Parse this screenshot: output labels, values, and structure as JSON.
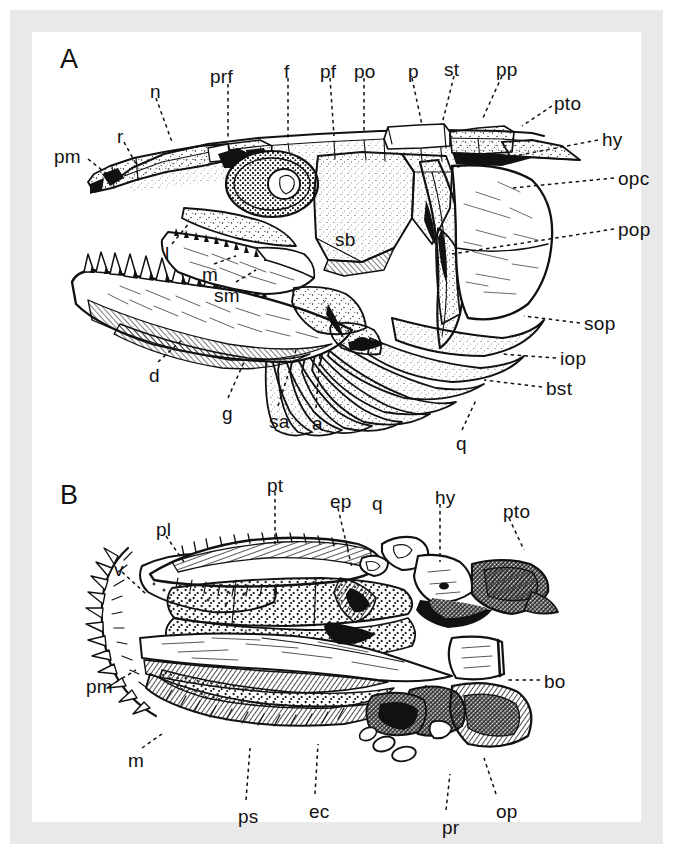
{
  "figure": {
    "caption_present": false,
    "background_color": "#ffffff",
    "mount_color": "#e9e9e9",
    "ink_color": "#111111",
    "panels": [
      {
        "id": "A",
        "letter": "A",
        "view": "lateral view of skull",
        "letter_pos": {
          "x": 28,
          "y": 14
        }
      },
      {
        "id": "B",
        "letter": "B",
        "view": "palatal (ventral) view of skull",
        "letter_pos": {
          "x": 28,
          "y": 450
        }
      }
    ],
    "labels_panel_a": [
      {
        "text": "A",
        "x": 28,
        "y": 14,
        "leader": null,
        "is_letter": true
      },
      {
        "text": "pm",
        "x": 22,
        "y": 115,
        "leader": {
          "x1": 56,
          "y1": 127,
          "x2": 80,
          "y2": 146
        }
      },
      {
        "text": "r",
        "x": 85,
        "y": 95,
        "leader": {
          "x1": 92,
          "y1": 110,
          "x2": 104,
          "y2": 132
        }
      },
      {
        "text": "n",
        "x": 118,
        "y": 50,
        "leader": {
          "x1": 124,
          "y1": 66,
          "x2": 140,
          "y2": 110
        }
      },
      {
        "text": "prf",
        "x": 178,
        "y": 35,
        "leader": {
          "x1": 196,
          "y1": 52,
          "x2": 196,
          "y2": 106
        }
      },
      {
        "text": "f",
        "x": 252,
        "y": 30,
        "leader": {
          "x1": 256,
          "y1": 46,
          "x2": 256,
          "y2": 106
        }
      },
      {
        "text": "pf",
        "x": 288,
        "y": 30,
        "leader": {
          "x1": 298,
          "y1": 46,
          "x2": 302,
          "y2": 104
        }
      },
      {
        "text": "po",
        "x": 322,
        "y": 30,
        "leader": {
          "x1": 332,
          "y1": 46,
          "x2": 332,
          "y2": 100
        }
      },
      {
        "text": "p",
        "x": 376,
        "y": 30,
        "leader": {
          "x1": 380,
          "y1": 46,
          "x2": 390,
          "y2": 93
        }
      },
      {
        "text": "st",
        "x": 412,
        "y": 28,
        "leader": {
          "x1": 422,
          "y1": 44,
          "x2": 410,
          "y2": 92
        }
      },
      {
        "text": "pp",
        "x": 464,
        "y": 28,
        "leader": {
          "x1": 470,
          "y1": 44,
          "x2": 450,
          "y2": 88
        }
      },
      {
        "text": "pto",
        "x": 522,
        "y": 62,
        "leader": {
          "x1": 520,
          "y1": 74,
          "x2": 490,
          "y2": 94
        }
      },
      {
        "text": "hy",
        "x": 570,
        "y": 98,
        "leader": {
          "x1": 566,
          "y1": 108,
          "x2": 420,
          "y2": 136
        }
      },
      {
        "text": "opc",
        "x": 586,
        "y": 137,
        "leader": {
          "x1": 582,
          "y1": 146,
          "x2": 480,
          "y2": 156
        }
      },
      {
        "text": "pop",
        "x": 586,
        "y": 188,
        "leader": {
          "x1": 582,
          "y1": 197,
          "x2": 420,
          "y2": 222
        }
      },
      {
        "text": "sop",
        "x": 552,
        "y": 282,
        "leader": {
          "x1": 548,
          "y1": 291,
          "x2": 492,
          "y2": 284
        }
      },
      {
        "text": "iop",
        "x": 528,
        "y": 317,
        "leader": {
          "x1": 524,
          "y1": 326,
          "x2": 470,
          "y2": 322
        }
      },
      {
        "text": "bst",
        "x": 514,
        "y": 347,
        "leader": {
          "x1": 510,
          "y1": 355,
          "x2": 452,
          "y2": 348
        }
      },
      {
        "text": "q",
        "x": 424,
        "y": 402,
        "leader": {
          "x1": 430,
          "y1": 398,
          "x2": 444,
          "y2": 368
        }
      },
      {
        "text": "sb",
        "x": 303,
        "y": 198,
        "leader": null
      },
      {
        "text": "l",
        "x": 133,
        "y": 212,
        "leader": {
          "x1": 140,
          "y1": 212,
          "x2": 158,
          "y2": 190
        }
      },
      {
        "text": "m",
        "x": 170,
        "y": 233,
        "leader": {
          "x1": 182,
          "y1": 232,
          "x2": 204,
          "y2": 224
        }
      },
      {
        "text": "sm",
        "x": 182,
        "y": 254,
        "leader": {
          "x1": 204,
          "y1": 250,
          "x2": 224,
          "y2": 238
        }
      },
      {
        "text": "d",
        "x": 117,
        "y": 334,
        "leader": {
          "x1": 126,
          "y1": 330,
          "x2": 150,
          "y2": 308
        }
      },
      {
        "text": "g",
        "x": 190,
        "y": 372,
        "leader": {
          "x1": 196,
          "y1": 366,
          "x2": 212,
          "y2": 330
        }
      },
      {
        "text": "sa",
        "x": 237,
        "y": 380,
        "leader": {
          "x1": 246,
          "y1": 374,
          "x2": 264,
          "y2": 318
        }
      },
      {
        "text": "a",
        "x": 280,
        "y": 382,
        "leader": {
          "x1": 284,
          "y1": 376,
          "x2": 288,
          "y2": 322
        }
      }
    ],
    "labels_panel_b": [
      {
        "text": "B",
        "x": 28,
        "y": 450,
        "leader": null,
        "is_letter": true
      },
      {
        "text": "pt",
        "x": 235,
        "y": 444,
        "leader": {
          "x1": 243,
          "y1": 460,
          "x2": 243,
          "y2": 512
        }
      },
      {
        "text": "ep",
        "x": 298,
        "y": 460,
        "leader": {
          "x1": 306,
          "y1": 476,
          "x2": 320,
          "y2": 536
        }
      },
      {
        "text": "q",
        "x": 340,
        "y": 462,
        "leader": null
      },
      {
        "text": "hy",
        "x": 403,
        "y": 456,
        "leader": {
          "x1": 408,
          "y1": 472,
          "x2": 408,
          "y2": 530
        }
      },
      {
        "text": "pto",
        "x": 471,
        "y": 470,
        "leader": {
          "x1": 477,
          "y1": 486,
          "x2": 492,
          "y2": 518
        }
      },
      {
        "text": "pl",
        "x": 124,
        "y": 488,
        "leader": {
          "x1": 134,
          "y1": 504,
          "x2": 152,
          "y2": 530
        }
      },
      {
        "text": "v",
        "x": 82,
        "y": 528,
        "leader": {
          "x1": 90,
          "y1": 540,
          "x2": 114,
          "y2": 562
        }
      },
      {
        "text": "pm",
        "x": 54,
        "y": 645,
        "leader": {
          "x1": 84,
          "y1": 650,
          "x2": 104,
          "y2": 638
        }
      },
      {
        "text": "m",
        "x": 96,
        "y": 719,
        "leader": {
          "x1": 110,
          "y1": 716,
          "x2": 130,
          "y2": 702
        }
      },
      {
        "text": "bo",
        "x": 512,
        "y": 640,
        "leader": {
          "x1": 508,
          "y1": 648,
          "x2": 474,
          "y2": 648
        }
      },
      {
        "text": "ps",
        "x": 206,
        "y": 775,
        "leader": {
          "x1": 214,
          "y1": 768,
          "x2": 218,
          "y2": 716
        }
      },
      {
        "text": "ec",
        "x": 277,
        "y": 770,
        "leader": {
          "x1": 283,
          "y1": 762,
          "x2": 286,
          "y2": 712
        }
      },
      {
        "text": "pr",
        "x": 410,
        "y": 786,
        "leader": {
          "x1": 414,
          "y1": 778,
          "x2": 418,
          "y2": 742
        }
      },
      {
        "text": "op",
        "x": 464,
        "y": 770,
        "leader": {
          "x1": 464,
          "y1": 762,
          "x2": 452,
          "y2": 726
        }
      }
    ],
    "abbreviations": {
      "a": "angular",
      "bo": "basioccipital",
      "bst": "branchiostegal ray",
      "d": "dentary",
      "ec": "ectopterygoid",
      "ep": "endopterygoid",
      "f": "frontal",
      "g": "gular",
      "hy": "hyomandibula",
      "iop": "interopercle",
      "l": "lacrimal",
      "m": "maxilla",
      "n": "nasal",
      "op": "opercular process",
      "opc": "opercle",
      "p": "parietal",
      "pf": "postfrontal",
      "pl": "palatine",
      "pm": "premaxilla",
      "po": "postorbital",
      "pop": "preopercle",
      "pp": "postparietal",
      "pr": "prootic",
      "prf": "prefrontal",
      "ps": "parasphenoid",
      "pt": "pterygoid",
      "pto": "pterotic",
      "q": "quadrate",
      "r": "rostral",
      "sa": "surangular",
      "sb": "suborbital",
      "sm": "supramaxilla",
      "sop": "subopercle",
      "st": "supratemporal",
      "v": "vomer"
    }
  }
}
